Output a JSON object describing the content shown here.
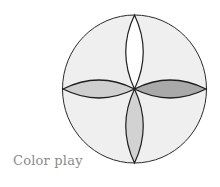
{
  "caption": "Color play",
  "diagram": {
    "circle": {
      "cx": 134.5,
      "cy": 89,
      "rx": 72,
      "ry": 74,
      "fill": "#efefef",
      "stroke": "#2a2a2a"
    },
    "petals": [
      {
        "name": "top",
        "fill": "#ffffff"
      },
      {
        "name": "right",
        "fill": "#a9a9a9"
      },
      {
        "name": "bottom",
        "fill": "#d2d2d2"
      },
      {
        "name": "left",
        "fill": "#cfcfcf"
      }
    ]
  }
}
